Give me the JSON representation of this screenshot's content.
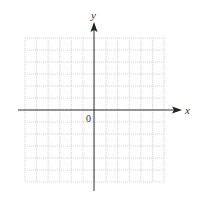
{
  "figure": {
    "type": "blank coordinate grid",
    "x_axis_label": "x",
    "y_axis_label": "y",
    "origin_label": "0",
    "grid": {
      "columns": 12,
      "rows": 12,
      "style": "dotted",
      "color": "#c8c8c8"
    },
    "axis_color": "#333333"
  }
}
